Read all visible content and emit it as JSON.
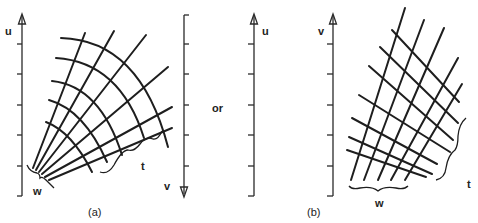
{
  "figure": {
    "partial_header_text": "",
    "panel_a": {
      "caption": "(a)",
      "left_axis_label": "u",
      "right_axis_label": "v",
      "brace_labels": {
        "width": "w",
        "length": "t"
      }
    },
    "separator": "or",
    "panel_b": {
      "caption": "(b)",
      "left_axis_label": "u",
      "right_axis_label": "v",
      "brace_labels": {
        "width": "w",
        "length": "t"
      }
    },
    "colors": {
      "ink": "#1e1e1e",
      "background": "#ffffff"
    }
  }
}
